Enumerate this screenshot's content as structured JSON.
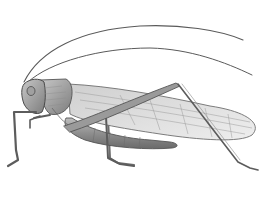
{
  "image": {
    "subject": "grasshopper",
    "style": "pencil illustration",
    "colors": {
      "background": "#ffffff",
      "outline": "#4a4a4a",
      "shade_dark": "#6b6b6b",
      "shade_mid": "#9a9a9a",
      "shade_light": "#cfcfcf",
      "wing": "#e2e2e2"
    }
  }
}
